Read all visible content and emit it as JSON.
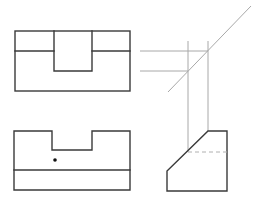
{
  "diagram": {
    "title": "",
    "views": [
      {
        "name": "front-view",
        "features": [
          "outer rectangle",
          "horizontal edge line",
          "rectangular slot notch"
        ]
      },
      {
        "name": "top-view",
        "features": [
          "outline with top notch",
          "horizontal edge line",
          "point marker"
        ]
      },
      {
        "name": "side-view",
        "features": [
          "chamfered outline",
          "hidden line (dashed)"
        ]
      }
    ],
    "construction": [
      "horizontal projection lines",
      "vertical projection lines",
      "45-degree miter line"
    ],
    "colors": {
      "object_line": "#3a3a3a",
      "projection_line": "#a8a8a8",
      "hidden_line": "#b0b0b0"
    }
  }
}
